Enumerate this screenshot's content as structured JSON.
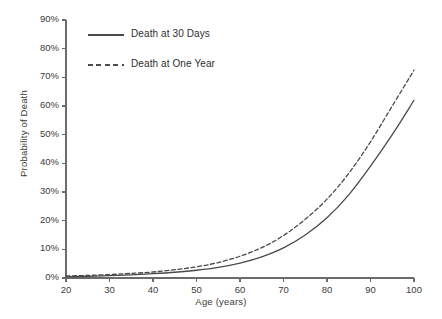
{
  "chart_data": {
    "type": "line",
    "title": "",
    "xlabel": "Age (years)",
    "ylabel": "Probability of Death",
    "xlim": [
      20,
      100
    ],
    "ylim": [
      0,
      90
    ],
    "grid": false,
    "legend_position": "upper-left-inside",
    "x_ticklabels": [
      "20",
      "30",
      "40",
      "50",
      "60",
      "70",
      "80",
      "90",
      "100"
    ],
    "x_tickvalues": [
      20,
      30,
      40,
      50,
      60,
      70,
      80,
      90,
      100
    ],
    "y_ticklabels": [
      "0%",
      "10%",
      "20%",
      "30%",
      "40%",
      "50%",
      "60%",
      "70%",
      "80%",
      "90%"
    ],
    "y_tickvalues": [
      0,
      10,
      20,
      30,
      40,
      50,
      60,
      70,
      80,
      90
    ],
    "x": [
      20,
      25,
      30,
      35,
      40,
      45,
      50,
      55,
      60,
      65,
      70,
      75,
      80,
      85,
      90,
      95,
      100
    ],
    "series": [
      {
        "name": "Death at 30 Days",
        "style": "solid",
        "color": "#4a4a4a",
        "values": [
          0.4,
          0.6,
          0.8,
          1.1,
          1.5,
          2.0,
          2.7,
          3.7,
          5.2,
          7.4,
          10.5,
          15.0,
          21.0,
          29.0,
          39.0,
          50.0,
          62.0
        ]
      },
      {
        "name": "Death at One Year",
        "style": "dashed",
        "color": "#4a4a4a",
        "values": [
          0.7,
          0.9,
          1.2,
          1.6,
          2.1,
          2.9,
          3.9,
          5.4,
          7.6,
          10.6,
          14.8,
          20.5,
          27.5,
          36.5,
          47.5,
          60.0,
          72.5
        ]
      }
    ]
  },
  "legend": {
    "items": [
      {
        "label": "Death at 30 Days",
        "style": "solid"
      },
      {
        "label": "Death at One Year",
        "style": "dashed"
      }
    ]
  },
  "axes": {
    "axis_color": "#6b6b6b",
    "text_color": "#3b3b3b"
  }
}
